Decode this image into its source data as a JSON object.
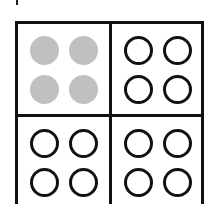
{
  "diagram": {
    "colors": {
      "border": "#111111",
      "filled": "#c0c0c0",
      "background": "#ffffff"
    },
    "cells": [
      {
        "position": "top-left",
        "circles": [
          "filled",
          "filled",
          "filled",
          "filled"
        ]
      },
      {
        "position": "top-right",
        "circles": [
          "empty",
          "empty",
          "empty",
          "empty"
        ]
      },
      {
        "position": "bottom-left",
        "circles": [
          "empty",
          "empty",
          "empty",
          "empty"
        ]
      },
      {
        "position": "bottom-right",
        "circles": [
          "empty",
          "empty",
          "empty",
          "empty"
        ]
      }
    ]
  }
}
